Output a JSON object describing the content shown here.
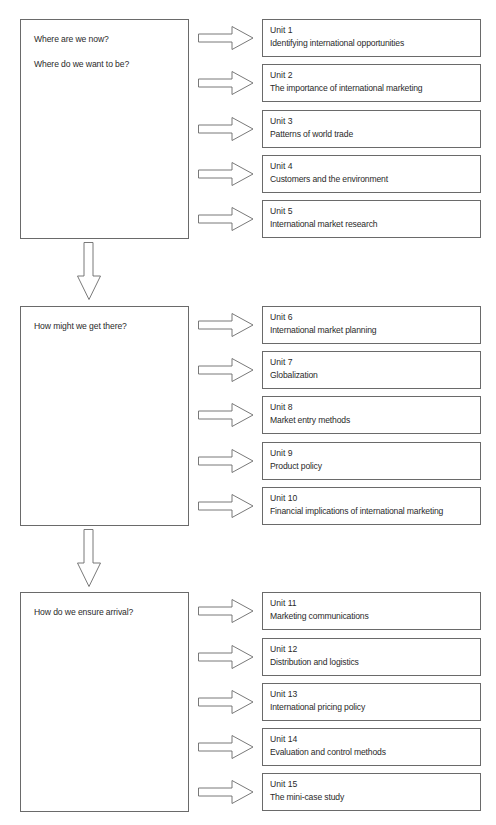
{
  "diagram": {
    "type": "flow",
    "stages": [
      {
        "questions": [
          "Where are we now?",
          "Where do we want to be?"
        ],
        "units": [
          {
            "number": "Unit 1",
            "title": "Identifying international opportunities"
          },
          {
            "number": "Unit 2",
            "title": "The importance of international marketing"
          },
          {
            "number": "Unit 3",
            "title": "Patterns of world trade"
          },
          {
            "number": "Unit 4",
            "title": "Customers and the environment"
          },
          {
            "number": "Unit 5",
            "title": "International market research"
          }
        ]
      },
      {
        "questions": [
          "How might we get there?"
        ],
        "units": [
          {
            "number": "Unit 6",
            "title": "International market planning"
          },
          {
            "number": "Unit 7",
            "title": "Globalization"
          },
          {
            "number": "Unit 8",
            "title": "Market entry methods"
          },
          {
            "number": "Unit 9",
            "title": "Product policy"
          },
          {
            "number": "Unit 10",
            "title": "Financial implications of international marketing"
          }
        ]
      },
      {
        "questions": [
          "How do we ensure arrival?"
        ],
        "units": [
          {
            "number": "Unit 11",
            "title": "Marketing communications"
          },
          {
            "number": "Unit 12",
            "title": "Distribution and logistics"
          },
          {
            "number": "Unit 13",
            "title": "International pricing policy"
          },
          {
            "number": "Unit 14",
            "title": "Evaluation and control methods"
          },
          {
            "number": "Unit 15",
            "title": "The mini-case study"
          }
        ]
      }
    ],
    "colors": {
      "stroke": "#6a6a6a",
      "text": "#2a2a2a",
      "background": "#ffffff"
    }
  }
}
